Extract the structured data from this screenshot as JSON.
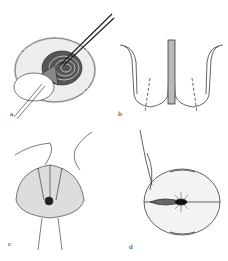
{
  "figure": {
    "panels": [
      {
        "id": "a",
        "label": "a",
        "description": "Circular tissue with concentric rings; instrument inserted from upper right, clamp holding flap at lower left"
      },
      {
        "id": "b",
        "label": "b",
        "description": "Cross-section of two rounded lobes with central column; dashed lines indicating cut paths"
      },
      {
        "id": "c",
        "label": "c",
        "description": "Dome-shaped structure with sutures looping over top; gathered center; tubular stem below"
      },
      {
        "id": "d",
        "label": "d",
        "description": "Oval structure with horizontal suture line, needle with thread at left, stitch marks top and bottom"
      }
    ],
    "colors": {
      "ink": "#222222",
      "background": "#ffffff"
    }
  }
}
